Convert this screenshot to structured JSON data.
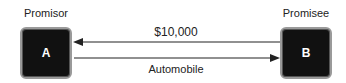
{
  "diagram": {
    "promisor": {
      "title": "Promisor",
      "letter": "A"
    },
    "promisee": {
      "title": "Promisee",
      "letter": "B"
    },
    "top_arrow": {
      "label": "$10,000",
      "direction": "B-to-A"
    },
    "bottom_arrow": {
      "label": "Automobile",
      "direction": "A-to-B"
    },
    "colors": {
      "box_fill": "#111111",
      "box_border": "#9a9a9a",
      "arrow": "#222222"
    }
  }
}
